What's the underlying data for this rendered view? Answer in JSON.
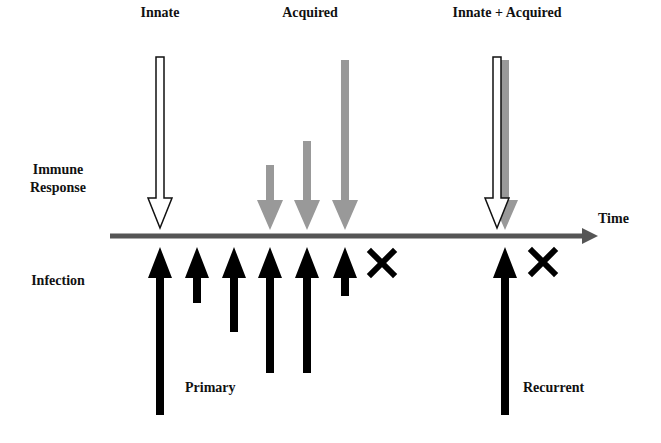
{
  "labels": {
    "innate": "Innate",
    "acquired": "Acquired",
    "innate_acquired": "Innate + Acquired",
    "immune_response_line1": "Immune",
    "immune_response_line2": "Response",
    "infection": "Infection",
    "time": "Time",
    "primary": "Primary",
    "recurrent": "Recurrent"
  },
  "colors": {
    "infection_arrow": "#000000",
    "acquired_arrow": "#999999",
    "innate_arrow_fill": "#ffffff",
    "innate_arrow_stroke": "#111111",
    "axis": "#555555",
    "block_mark": "#000000"
  },
  "diagram": {
    "axis": {
      "x1": 110,
      "x2": 598,
      "y": 236
    },
    "innate_arrows": [
      {
        "x": 160,
        "top": 57
      },
      {
        "x": 497,
        "top": 57
      }
    ],
    "acquired_arrows": [
      {
        "x": 270,
        "top": 165
      },
      {
        "x": 307,
        "top": 141
      },
      {
        "x": 345,
        "top": 60
      },
      {
        "x": 505,
        "top": 60
      }
    ],
    "infection_arrows": [
      {
        "x": 160,
        "bottom": 415
      },
      {
        "x": 197,
        "bottom": 303
      },
      {
        "x": 234,
        "bottom": 332
      },
      {
        "x": 270,
        "bottom": 373
      },
      {
        "x": 307,
        "bottom": 373
      },
      {
        "x": 345,
        "bottom": 296
      },
      {
        "x": 505,
        "bottom": 415
      }
    ],
    "block_marks": [
      {
        "x": 382,
        "y": 263
      },
      {
        "x": 543,
        "y": 262
      }
    ]
  }
}
